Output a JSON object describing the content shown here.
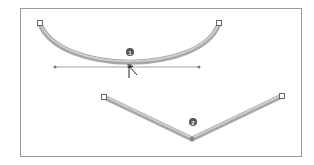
{
  "figure": {
    "frame_color": "#9a9a9a",
    "stroke_color": "#a8a8a8",
    "stroke_highlight": "#d0d0d0",
    "handle_line_color": "#8a8a8a",
    "callout_color": "#555555",
    "callouts": [
      {
        "id": "callout-1",
        "label": "1"
      },
      {
        "id": "callout-2",
        "label": "2"
      }
    ],
    "shapes": [
      {
        "name": "smooth-curve-path",
        "type": "curve",
        "anchor_point": "smooth"
      },
      {
        "name": "corner-angle-path",
        "type": "polyline",
        "anchor_point": "corner"
      }
    ]
  }
}
